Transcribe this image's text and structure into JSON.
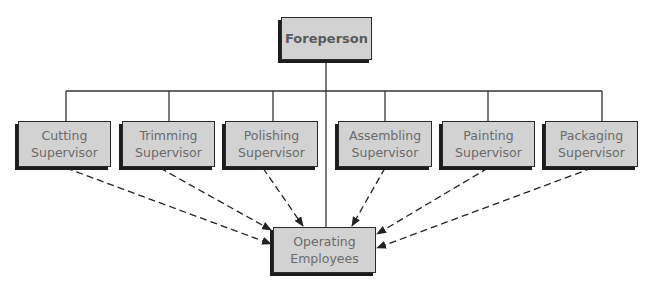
{
  "diagram": {
    "type": "org-chart",
    "top": {
      "label": "Foreperson"
    },
    "supervisors": [
      {
        "label": "Cutting\nSupervisor"
      },
      {
        "label": "Trimming\nSupervisor"
      },
      {
        "label": "Polishing\nSupervisor"
      },
      {
        "label": "Assembling\nSupervisor"
      },
      {
        "label": "Painting\nSupervisor"
      },
      {
        "label": "Packaging\nSupervisor"
      }
    ],
    "bottom": {
      "label": "Operating\nEmployees"
    },
    "edges": {
      "solid": "Foreperson to each Supervisor and to Operating Employees",
      "dashed": "Each Supervisor to Operating Employees (arrow)"
    },
    "colors": {
      "box_fill": "#d2d2d2",
      "box_border": "#2a2a2a",
      "line": "#333333",
      "text": "#6a6a6a"
    }
  }
}
